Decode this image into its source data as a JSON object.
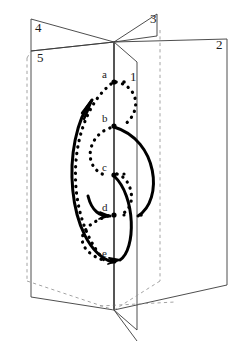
{
  "figure": {
    "type": "geometric-diagram",
    "canvas": {
      "width": 248,
      "height": 357
    },
    "colors": {
      "line": "#3a3a3a",
      "hidden_line": "#8a8a8a",
      "axis": "#555555",
      "curve": "#000000",
      "label": "#1a1a1a",
      "background": "#ffffff"
    },
    "plane_labels": [
      {
        "name": "plane-label-4",
        "text": "4",
        "x": 35,
        "y": 27
      },
      {
        "name": "plane-label-3",
        "text": "3",
        "x": 152,
        "y": 18
      },
      {
        "name": "plane-label-2",
        "text": "2",
        "x": 218,
        "y": 45
      },
      {
        "name": "plane-label-5",
        "text": "5",
        "x": 38,
        "y": 57
      },
      {
        "name": "plane-label-1",
        "text": "1",
        "x": 131,
        "y": 75
      }
    ],
    "point_labels": [
      {
        "name": "point-label-a",
        "text": "a",
        "x": 101,
        "y": 74
      },
      {
        "name": "point-label-b",
        "text": "b",
        "x": 101,
        "y": 118
      },
      {
        "name": "point-label-c",
        "text": "c",
        "x": 101,
        "y": 167
      },
      {
        "name": "point-label-d",
        "text": "d",
        "x": 101,
        "y": 207
      },
      {
        "name": "point-label-e",
        "text": "e",
        "x": 101,
        "y": 253
      }
    ],
    "axis_points": [
      {
        "id": "a",
        "x": 114,
        "y": 82
      },
      {
        "id": "b",
        "x": 114,
        "y": 126
      },
      {
        "id": "c",
        "x": 114,
        "y": 175
      },
      {
        "id": "d",
        "x": 114,
        "y": 215
      },
      {
        "id": "e",
        "x": 114,
        "y": 261
      }
    ],
    "axis": {
      "top_x": 114,
      "top_y": 42,
      "bottom_x": 114,
      "bottom_y": 310
    },
    "arcs": [
      {
        "name": "arc-e-to-a-solid",
        "style": "solid",
        "from": "e",
        "to": "a",
        "side": "left",
        "arrow": "at-a"
      },
      {
        "name": "arc-a-to-b-dotted",
        "style": "dotted",
        "from": "a",
        "to": "b",
        "side": "right"
      },
      {
        "name": "arc-b-to-c-dotted",
        "style": "dotted",
        "from": "b",
        "to": "c",
        "side": "left"
      },
      {
        "name": "arc-b-to-d-solid",
        "style": "solid",
        "from": "b",
        "to": "d",
        "side": "right"
      },
      {
        "name": "arc-c-to-d-dotted",
        "style": "dotted",
        "from": "c",
        "to": "d",
        "side": "right"
      },
      {
        "name": "arc-c-to-e-solid",
        "style": "solid",
        "from": "c",
        "to": "e",
        "side": "right",
        "arrow": "at-e"
      },
      {
        "name": "arc-d-to-e-dotted",
        "style": "dotted",
        "from": "d",
        "to": "e",
        "side": "left"
      },
      {
        "name": "arc-d-solid-stub",
        "style": "solid",
        "from": "c",
        "to": "d",
        "side": "left",
        "arrow": "at-d"
      }
    ]
  }
}
